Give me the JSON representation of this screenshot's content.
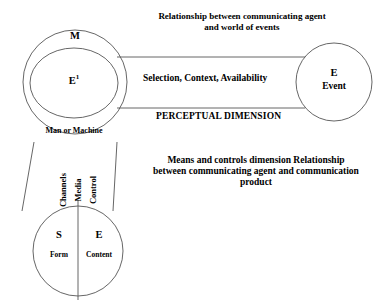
{
  "diagram": {
    "stroke_color": "#555555",
    "text_color": "#000000",
    "background": "#ffffff",
    "agent_node": {
      "outer_label": "M",
      "inner_label_base": "E",
      "inner_label_sup": "1",
      "caption": "Man or Machine"
    },
    "event_node": {
      "letter": "E",
      "name": "Event"
    },
    "product_node": {
      "left_letter": "S",
      "left_caption": "Form",
      "right_letter": "E",
      "right_caption": "Content"
    },
    "channel_labels": {
      "channels": "Channels",
      "media": "Media",
      "control": "Control"
    },
    "annotations": {
      "world_of_events": "Relationship between communicating agent and world of events",
      "selection": "Selection, Context, Availability",
      "perceptual_dimension": "PERCEPTUAL DIMENSION",
      "means_and_controls": "Means and controls dimension Relationship between communicating agent and communication product"
    }
  }
}
